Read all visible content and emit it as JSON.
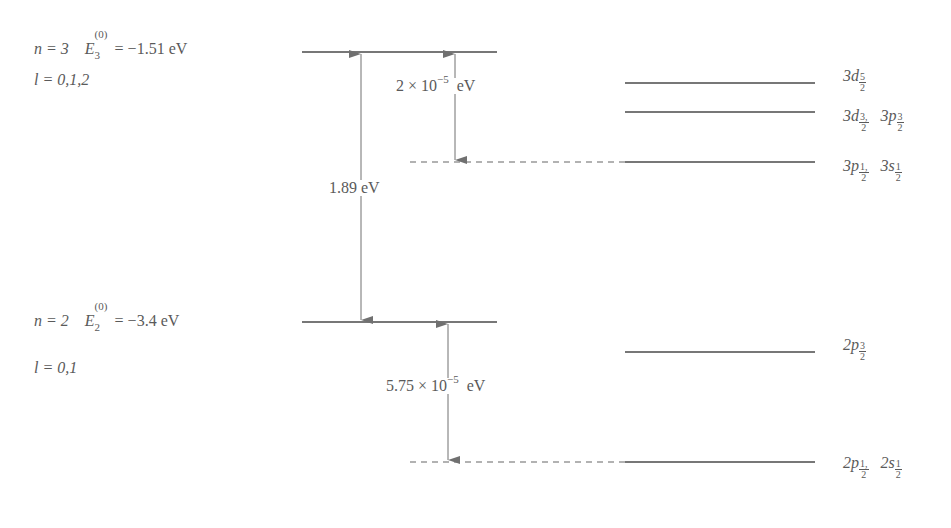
{
  "diagram": {
    "type": "energy-level-diagram",
    "colors": {
      "line": "#4a4a4a",
      "arrow": "#707070",
      "text": "#5a5a5a",
      "background": "#ffffff"
    },
    "levels": [
      {
        "id": "n3",
        "n_label": "n = 3",
        "energy_symbol": "E",
        "energy_superscript": "(0)",
        "energy_subscript": "3",
        "energy_value": "= −1.51  eV",
        "l_label": "l = 0,1,2",
        "fine_structure": [
          {
            "label_main": "3d",
            "label_frac_num": "5",
            "label_frac_den": "2",
            "extra": ""
          },
          {
            "label_main": "3d",
            "label_frac_num": "3,",
            "label_frac_den": "2",
            "extra_main": "3p",
            "extra_num": "3",
            "extra_den": "2"
          },
          {
            "label_main": "3p",
            "label_frac_num": "1,",
            "label_frac_den": "2",
            "extra_main": "3s",
            "extra_num": "1",
            "extra_den": "2"
          }
        ],
        "splitting": "2 × 10",
        "splitting_exp": "−5",
        "splitting_unit": "eV"
      },
      {
        "id": "n2",
        "n_label": "n = 2",
        "energy_symbol": "E",
        "energy_superscript": "(0)",
        "energy_subscript": "2",
        "energy_value": "= −3.4  eV",
        "l_label": "l = 0,1",
        "fine_structure": [
          {
            "label_main": "2p",
            "label_frac_num": "3",
            "label_frac_den": "2"
          },
          {
            "label_main": "2p",
            "label_frac_num": "1,",
            "label_frac_den": "2",
            "extra_main": "2s",
            "extra_num": "1",
            "extra_den": "2"
          }
        ],
        "splitting": "5.75 × 10",
        "splitting_exp": "−5",
        "splitting_unit": "eV"
      }
    ],
    "transition": {
      "label": "1.89  eV"
    }
  }
}
